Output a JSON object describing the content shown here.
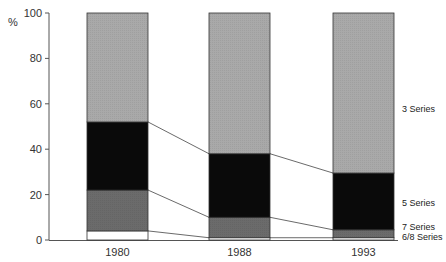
{
  "chart_data": {
    "type": "bar",
    "stacked": true,
    "percent": true,
    "title": "",
    "xlabel": "",
    "ylabel": "%",
    "ylim": [
      0,
      100
    ],
    "yticks": [
      0,
      20,
      40,
      60,
      80,
      100
    ],
    "grid": false,
    "categories": [
      "1980",
      "1988",
      "1993"
    ],
    "series": [
      {
        "name": "6/8 Series",
        "values": [
          4,
          1,
          1
        ],
        "color": "#ffffff"
      },
      {
        "name": "7 Series",
        "values": [
          18,
          9,
          3.5
        ],
        "color": "#6b6b6b"
      },
      {
        "name": "5 Series",
        "values": [
          30,
          28,
          25
        ],
        "color": "#0a0a0a"
      },
      {
        "name": "3 Series",
        "values": [
          48,
          62,
          70.5
        ],
        "color": "#a9a9a9"
      }
    ],
    "legend": {
      "position": "right, inline labels",
      "entries": [
        "3 Series",
        "5 Series",
        "7 Series",
        "6/8 Series"
      ]
    },
    "connector_lines": true
  }
}
